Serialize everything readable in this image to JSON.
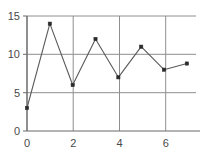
{
  "chart_data": {
    "type": "line",
    "title": "",
    "xlabel": "",
    "ylabel": "",
    "x": [
      0,
      1,
      2,
      3,
      4,
      5,
      6,
      7
    ],
    "values": [
      3,
      14,
      6,
      12,
      7,
      11,
      8,
      8.8
    ],
    "series": [
      {
        "name": "",
        "values": [
          3,
          14,
          6,
          12,
          7,
          11,
          8,
          8.8
        ]
      }
    ],
    "xlim": [
      0,
      7.4
    ],
    "ylim": [
      0,
      15
    ],
    "xticks": [
      0,
      2,
      4,
      6
    ],
    "yticks": [
      0,
      5,
      10,
      15
    ],
    "xtick_labels": [
      "0",
      "2",
      "4",
      "6"
    ],
    "ytick_labels": [
      "0",
      "5",
      "10",
      "15"
    ],
    "grid": true,
    "grid_x": [
      0,
      2,
      4,
      6
    ],
    "grid_y": [
      5,
      10,
      15
    ],
    "legend": null,
    "marker": "square",
    "line_color": "#5a5a5a",
    "marker_color": "#2b2b2b",
    "grid_color": "#8e8e8e",
    "axis_color": "#6b6b6b",
    "background": "#ffffff"
  }
}
